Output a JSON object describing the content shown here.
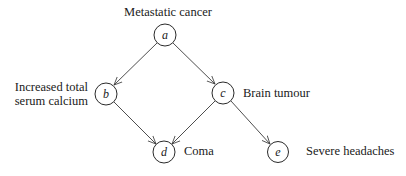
{
  "diagram": {
    "type": "bayesian-network",
    "nodes": [
      {
        "id": "a",
        "letter": "a",
        "label": "Metastatic cancer",
        "cx": 165,
        "cy": 35
      },
      {
        "id": "b",
        "letter": "b",
        "label_lines": [
          "Increased total",
          "serum calcium"
        ],
        "cx": 106,
        "cy": 94
      },
      {
        "id": "c",
        "letter": "c",
        "label": "Brain tumour",
        "cx": 223,
        "cy": 93
      },
      {
        "id": "d",
        "letter": "d",
        "label": "Coma",
        "cx": 164,
        "cy": 152
      },
      {
        "id": "e",
        "letter": "e",
        "label": "Severe headaches",
        "cx": 278,
        "cy": 152
      }
    ],
    "edges": [
      {
        "from": "a",
        "to": "b"
      },
      {
        "from": "a",
        "to": "c"
      },
      {
        "from": "b",
        "to": "d"
      },
      {
        "from": "c",
        "to": "d"
      },
      {
        "from": "c",
        "to": "e"
      }
    ],
    "node_radius": 11
  },
  "labels": {
    "a": "Metastatic cancer",
    "b_line1": "Increased total",
    "b_line2": "serum calcium",
    "c": "Brain tumour",
    "d": "Coma",
    "e": "Severe headaches"
  },
  "letters": {
    "a": "a",
    "b": "b",
    "c": "c",
    "d": "d",
    "e": "e"
  }
}
